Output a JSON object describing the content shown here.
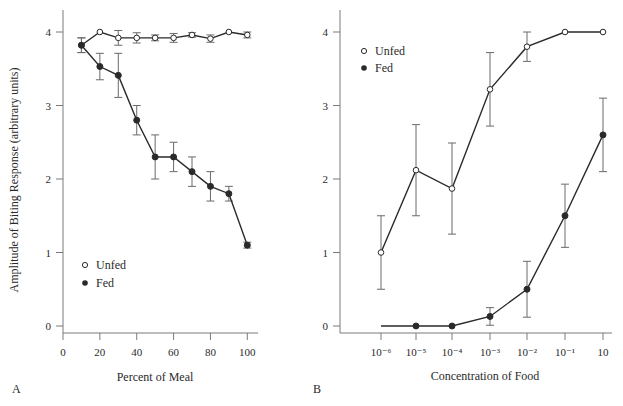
{
  "chart_data": [
    {
      "panel": "A",
      "type": "line",
      "title": "",
      "xlabel": "Percent of Meal",
      "ylabel": "Amplitude of Biting Response (arbitrary units)",
      "xlim": [
        0,
        105
      ],
      "ylim": [
        0,
        4.2
      ],
      "xticks": [
        0,
        20,
        40,
        60,
        80,
        100
      ],
      "yticks": [
        0,
        1,
        2,
        3,
        4
      ],
      "grid": false,
      "legend": {
        "position": "lower left",
        "entries": [
          "Unfed",
          "Fed"
        ]
      },
      "x": [
        10,
        20,
        30,
        40,
        50,
        60,
        70,
        80,
        90,
        100
      ],
      "series": [
        {
          "name": "Unfed",
          "marker": "open-circle",
          "values": [
            3.82,
            4.0,
            3.92,
            3.92,
            3.92,
            3.92,
            3.96,
            3.91,
            4.0,
            3.96
          ],
          "errors": [
            0.1,
            0,
            0.1,
            0.07,
            0.04,
            0.06,
            0.03,
            0.05,
            0,
            0.04
          ]
        },
        {
          "name": "Fed",
          "marker": "filled-circle",
          "values": [
            3.82,
            3.53,
            3.41,
            2.8,
            2.3,
            2.3,
            2.1,
            1.9,
            1.8,
            1.1
          ],
          "errors": [
            0.1,
            0.18,
            0.3,
            0.2,
            0.3,
            0.2,
            0.2,
            0.2,
            0.1,
            0.04
          ]
        }
      ]
    },
    {
      "panel": "B",
      "type": "line",
      "title": "",
      "xlabel": "Concentration of Food",
      "ylabel": "Amplitude of Biting Response (arbitrary units)",
      "ylim": [
        0,
        4.2
      ],
      "categories": [
        "10⁻⁶",
        "10⁻⁵",
        "10⁻⁴",
        "10⁻³",
        "10⁻²",
        "10⁻¹",
        "10"
      ],
      "yticks": [
        0,
        1,
        2,
        3,
        4
      ],
      "grid": false,
      "legend": {
        "position": "upper left",
        "entries": [
          "Unfed",
          "Fed"
        ]
      },
      "series": [
        {
          "name": "Unfed",
          "marker": "open-circle",
          "values": [
            1.0,
            2.12,
            1.87,
            3.22,
            3.8,
            4.0,
            4.0
          ],
          "errors": [
            0.5,
            0.62,
            0.62,
            0.5,
            0.2,
            0,
            0
          ]
        },
        {
          "name": "Fed",
          "marker": "filled-circle",
          "values": [
            0,
            0,
            0,
            0.13,
            0.5,
            1.5,
            2.6
          ],
          "errors": [
            0,
            0,
            0,
            0.12,
            0.38,
            0.43,
            0.5
          ],
          "markers_shown": [
            false,
            true,
            true,
            true,
            true,
            true,
            true
          ]
        }
      ]
    }
  ],
  "panels": {
    "a": {
      "letter": "A",
      "xlabel": "Percent of Meal",
      "ylabel": "Amplitude of Biting Response (arbitrary units)",
      "legend_unfed": "Unfed",
      "legend_fed": "Fed",
      "xtick_labels": [
        "0",
        "20",
        "40",
        "60",
        "80",
        "100"
      ],
      "ytick_labels": [
        "0",
        "1",
        "2",
        "3",
        "4"
      ]
    },
    "b": {
      "letter": "B",
      "xlabel": "Concentration of Food",
      "legend_unfed": "Unfed",
      "legend_fed": "Fed",
      "xtick_labels": [
        "10⁻⁶",
        "10⁻⁵",
        "10⁻⁴",
        "10⁻³",
        "10⁻²",
        "10⁻¹",
        "10"
      ],
      "ytick_labels": [
        "0",
        "1",
        "2",
        "3",
        "4"
      ]
    }
  },
  "colors": {
    "ink": "#2a2a2a",
    "axis": "#7a7a7a",
    "errorbar": "#6a6a6a",
    "background": "#ffffff"
  }
}
